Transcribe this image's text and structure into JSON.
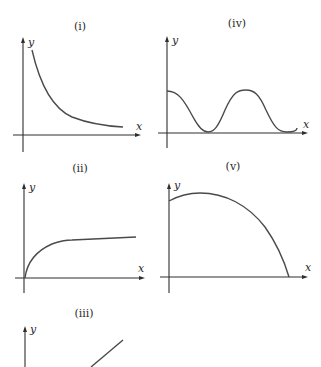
{
  "graphs": [
    {
      "id": "i",
      "title": "(i)",
      "x_label": "x",
      "y_label": "y",
      "shape": "decreasing curve approaching x-axis asymptotically (reciprocal-like)"
    },
    {
      "id": "iv",
      "title": "(iv)",
      "x_label": "x",
      "y_label": "y",
      "shape": "periodic wave starting at maximum on y-axis, touching x-axis at minima (cosine-squared-like)"
    },
    {
      "id": "ii",
      "title": "(ii)",
      "x_label": "x",
      "y_label": "y",
      "shape": "curve rising steeply from origin then levelling to a nearly flat line"
    },
    {
      "id": "v",
      "title": "(v)",
      "x_label": "x",
      "y_label": "y",
      "shape": "curve starting at positive y-intercept, rising to a maximum, then falling to meet the x-axis"
    },
    {
      "id": "iii",
      "title": "(iii)",
      "x_label": "x",
      "y_label": "y",
      "shape": "straight line with positive slope (partially visible)"
    }
  ],
  "colors": {
    "axis": "#2e2e2e",
    "curve": "#4a4a4a",
    "background": "#ffffff"
  }
}
